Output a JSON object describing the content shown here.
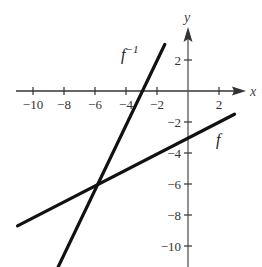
{
  "chart_data": {
    "type": "line",
    "title": "",
    "xlabel": "x",
    "ylabel": "y",
    "xlim": [
      -11,
      3
    ],
    "ylim": [
      -11,
      3
    ],
    "grid": false,
    "x_ticks": [
      -10,
      -8,
      -6,
      -4,
      -2,
      2
    ],
    "y_ticks": [
      2,
      -2,
      -4,
      -6,
      -8,
      -10
    ],
    "x_tick_labels": [
      "−10",
      "−8",
      "−6",
      "−4",
      "−2",
      "2"
    ],
    "y_tick_labels": [
      "2",
      "−2",
      "−4",
      "−6",
      "−8",
      "−10"
    ],
    "series": [
      {
        "name": "f",
        "label": "f",
        "points": [
          [
            -11,
            -8.7
          ],
          [
            3,
            -1.5
          ]
        ],
        "slope": 0.5,
        "intercept": -3
      },
      {
        "name": "f^-1",
        "label": "f",
        "label_sup": "−1",
        "points": [
          [
            -8.4,
            -11.4
          ],
          [
            -1.5,
            3
          ]
        ],
        "slope": 2,
        "intercept": 6
      }
    ],
    "annotations": [
      {
        "text": "f",
        "near": [
          2,
          -3.2
        ]
      },
      {
        "text": "f⁻¹",
        "near": [
          -3.8,
          2
        ]
      }
    ],
    "intersection": [
      -6,
      -6
    ]
  },
  "labels": {
    "x_axis": "x",
    "y_axis": "y",
    "f": "f",
    "finv_base": "f",
    "finv_sup": "−1"
  }
}
